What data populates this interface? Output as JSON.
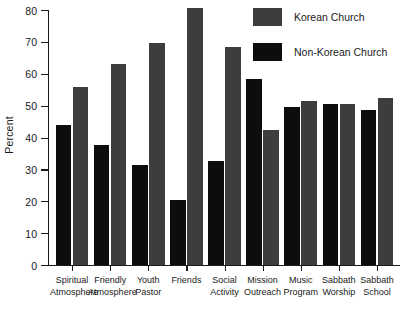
{
  "chart_data": {
    "type": "bar",
    "title": "",
    "xlabel": "",
    "ylabel": "Percent",
    "ylim": [
      0,
      80
    ],
    "ytick_labels": [
      "0",
      "10",
      "20",
      "30",
      "40",
      "50",
      "60",
      "70",
      "80"
    ],
    "ytick_values": [
      0,
      10,
      20,
      30,
      40,
      50,
      60,
      70,
      80
    ],
    "grid": false,
    "legend_position": "top-right",
    "categories": [
      "Spiritual\nAtmosphere",
      "Friendly\nAtmosphere",
      "Youth\nPastor",
      "Friends",
      "Social\nActivity",
      "Mission\nOutreach",
      "Music\nProgram",
      "Sabbath\nWorship",
      "Sabbath\nSchool"
    ],
    "series": [
      {
        "name": "Non-Korean Church",
        "color": "#0d0d0d",
        "values": [
          44,
          37.5,
          31.5,
          20.5,
          32.5,
          58.5,
          49.5,
          50.5,
          48.5
        ]
      },
      {
        "name": "Korean Church",
        "color": "#3d3d3d",
        "values": [
          56,
          63,
          69.5,
          80.5,
          68.5,
          42.5,
          51.5,
          50.5,
          52.5
        ]
      }
    ]
  },
  "legend": {
    "entries": [
      {
        "label": "Korean Church",
        "swatch": "korean"
      },
      {
        "label": "Non-Korean Church",
        "swatch": "nonkorean"
      }
    ]
  }
}
